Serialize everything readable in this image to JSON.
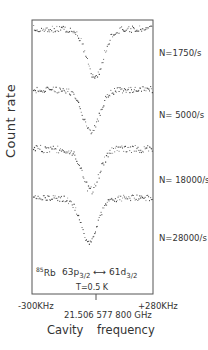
{
  "chart_data": {
    "type": "scatter",
    "title": "",
    "xlabel": "Cavity frequency",
    "ylabel": "Count rate",
    "x_ticks": {
      "left": "-300KHz",
      "center": "21.506 577 800 GHz",
      "right": "+280KHz"
    },
    "xlim_khz": [
      -300,
      280
    ],
    "grid": false,
    "legend_position": "right (per-trace labels)",
    "annotation": {
      "isotope_mass": "85",
      "element": "Rb",
      "transition_from": "63p",
      "from_sub": "3/2",
      "arrow": "⟷",
      "transition_to": "61d",
      "to_sub": "3/2",
      "temperature": "T=0.5 K"
    },
    "series": [
      {
        "name": "N=1750/s",
        "label": "N=1750/s",
        "baseline_px": 28,
        "min_px": 76,
        "center_khz": 0,
        "dip_depth_rel": 1.0,
        "noise": 3.2
      },
      {
        "name": "N=5000/s",
        "label": "N= 5000/s",
        "baseline_px": 89,
        "min_px": 131,
        "center_khz": -20,
        "dip_depth_rel": 0.9,
        "noise": 3.0
      },
      {
        "name": "N=18000/s",
        "label": "N= 18000/s",
        "baseline_px": 148,
        "min_px": 190,
        "center_khz": -20,
        "dip_depth_rel": 0.9,
        "noise": 3.8
      },
      {
        "name": "N=28000/s",
        "label": "N=28000/s",
        "baseline_px": 197,
        "min_px": 241,
        "center_khz": -28,
        "dip_depth_rel": 0.95,
        "noise": 3.0
      }
    ]
  },
  "frame": {
    "left": 32,
    "top": 20,
    "right": 153,
    "bottom": 294
  },
  "colors": {
    "ink": "#333333",
    "background": "#ffffff"
  }
}
